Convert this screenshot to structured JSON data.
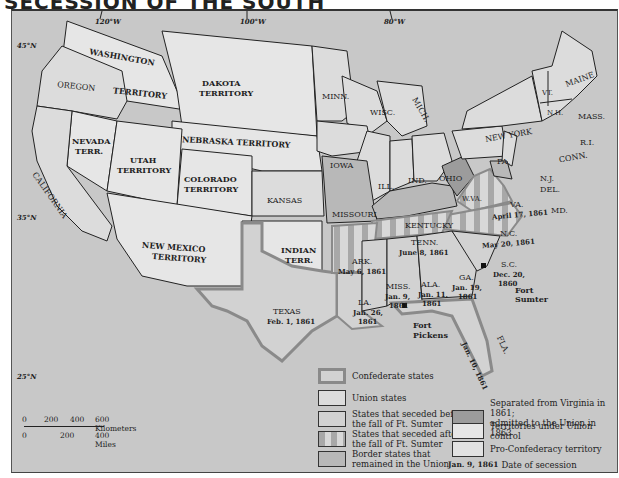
{
  "title": "SECESSION OF THE SOUTH",
  "colors": {
    "sea": "#c8c8c8",
    "union": "#dcdcdc",
    "territory": "#e6e6e6",
    "confederate_before": "#d2d2d2",
    "border_state": "#b8b8b8",
    "wva": "#9c9c9c",
    "stripe_dark": "#a8a8a8",
    "stripe_light": "#d8d8d8",
    "confederate_outline": "#8a8a8a"
  },
  "longitudes": [
    "120°W",
    "100°W",
    "80°W"
  ],
  "latitudes": [
    "45°N",
    "35°N",
    "25°N"
  ],
  "regions": {
    "washington_top": "WASHINGTON",
    "washington_bottom": "TERRITORY",
    "oregon": "OREGON",
    "dakota_1": "DAKOTA",
    "dakota_2": "TERRITORY",
    "nebraska": "NEBRASKA TERRITORY",
    "nevada_1": "NEVADA",
    "nevada_2": "TERR.",
    "utah_1": "UTAH",
    "utah_2": "TERRITORY",
    "colorado_1": "COLORADO",
    "colorado_2": "TERRITORY",
    "california": "CALIFORNIA",
    "kansas": "KANSAS",
    "new_mexico_1": "NEW MEXICO",
    "new_mexico_2": "TERRITORY",
    "indian_1": "INDIAN",
    "indian_2": "TERR.",
    "texas": "TEXAS",
    "texas_date": "Feb. 1, 1861",
    "minn": "MINN.",
    "wisc": "WISC.",
    "mich": "MICH.",
    "iowa": "IOWA",
    "ill": "ILL.",
    "ind": "IND.",
    "ohio": "OHIO",
    "missouri": "MISSOURI",
    "kentucky": "KENTUCKY",
    "new_york": "NEW YORK",
    "pa": "PA.",
    "vt": "VT.",
    "nh": "N.H.",
    "maine": "MAINE",
    "mass": "MASS.",
    "ri": "R.I.",
    "conn": "CONN.",
    "nj": "N.J.",
    "del": "DEL.",
    "md": "MD.",
    "wva": "W.VA.",
    "va": "VA.",
    "va_date": "April 17, 1861",
    "nc": "N.C.",
    "nc_date": "May 20, 1861",
    "tenn": "TENN.",
    "tenn_date": "June 8, 1861",
    "ark": "ARK.",
    "ark_date": "May 6, 1861",
    "la": "LA.",
    "la_date_1": "Jan. 26,",
    "la_date_2": "1861",
    "miss": "MISS.",
    "miss_date_1": "Jan. 9,",
    "miss_date_2": "1861",
    "ala": "ALA.",
    "ala_date_1": "Jan. 11,",
    "ala_date_2": "1861",
    "ga": "GA.",
    "ga_date_1": "Jan. 19,",
    "ga_date_2": "1861",
    "sc": "S.C.",
    "sc_date_1": "Dec. 20,",
    "sc_date_2": "1860",
    "fla": "FLA.",
    "fla_date": "Jan. 10, 1861",
    "fort_sumter_1": "Fort",
    "fort_sumter_2": "Sumter",
    "fort_pickens_1": "Fort",
    "fort_pickens_2": "Pickens"
  },
  "legend": {
    "items": [
      {
        "label": "Confederate states"
      },
      {
        "label": "Union states"
      },
      {
        "label_1": "States that seceded before",
        "label_2": "the fall of Ft. Sumter"
      },
      {
        "label_1": "States that seceded after",
        "label_2": "the fall of Ft. Sumter"
      },
      {
        "label_1": "Border states that",
        "label_2": "remained in the Union"
      },
      {
        "label_1": "Separated from Virginia in 1861;",
        "label_2": "admitted to the Union in 1863"
      },
      {
        "label": "Territories under Union control"
      },
      {
        "label": "Pro-Confederacy territory"
      }
    ],
    "date_example": "Jan. 9, 1861",
    "date_label": "Date of secession"
  },
  "scale": {
    "km_ticks": [
      "0",
      "200",
      "400",
      "600 Kilometers"
    ],
    "mile_ticks": [
      "0",
      "200",
      "400 Miles"
    ]
  }
}
